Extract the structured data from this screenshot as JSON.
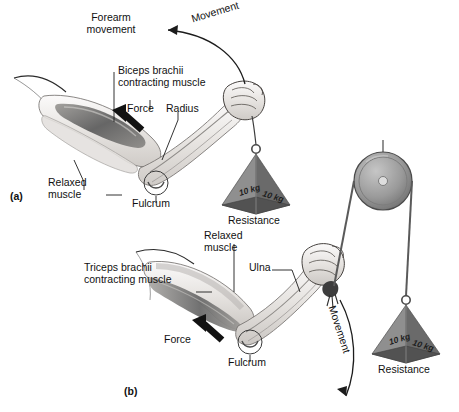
{
  "figure": {
    "type": "anatomical-diagram",
    "background_color": "#ffffff",
    "ink_color": "#111111"
  },
  "panels": [
    {
      "id": "a",
      "id_label": "(a)",
      "description": "Elbow flexion — biceps brachii contracting raises the forearm and the suspended weight",
      "labels": {
        "movement": "Movement",
        "forearm_movement": "Forearm\nmovement",
        "contracting_muscle": "Biceps brachii\ncontracting muscle",
        "force": "Force",
        "bone": "Radius",
        "relaxed_muscle": "Relaxed\nmuscle",
        "fulcrum": "Fulcrum",
        "resistance": "Resistance"
      },
      "weight": {
        "face_left": "10 kg",
        "face_right": "10 kg",
        "shape": "pyramid"
      }
    },
    {
      "id": "b",
      "id_label": "(b)",
      "description": "Elbow extension — triceps brachii contracting lowers the forearm against a pulley-routed weight",
      "labels": {
        "movement": "Movement",
        "contracting_muscle": "Triceps brachii\ncontracting muscle",
        "relaxed_muscle": "Relaxed\nmuscle",
        "bone": "Ulna",
        "force": "Force",
        "fulcrum": "Fulcrum",
        "resistance": "Resistance"
      },
      "weight": {
        "face_left": "10 kg",
        "face_right": "10 kg",
        "shape": "pyramid"
      },
      "pulley": {
        "present": true,
        "name": "pulley-wheel"
      }
    }
  ],
  "colors": {
    "skin_light": "#f2f0ee",
    "skin_mid": "#d9d5d1",
    "muscle_dark": "#6e6e6e",
    "muscle_mid": "#a8a6a3",
    "weight_left": "#8c8c8c",
    "weight_right": "#6b6b6b",
    "weight_top": "#b4b4b4",
    "pulley_rim": "#8a8a8a",
    "pulley_face": "#9e9e9e",
    "arrow_black": "#121212"
  }
}
